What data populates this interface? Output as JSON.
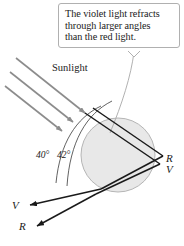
{
  "figure": {
    "background_color": "#ffffff",
    "width": 184,
    "height": 246
  },
  "callout": {
    "line1": "The violet light refracts",
    "line2": "through larger angles",
    "line3": "than the red light.",
    "border_color": "#b0b0b0",
    "background_color": "#ffffff"
  },
  "labels": {
    "sunlight": "Sunlight",
    "angle_inner": "40°",
    "angle_outer": "42°",
    "ray_r_right": "R",
    "ray_v_right": "V",
    "ray_v_left": "V",
    "ray_r_left": "R"
  },
  "colors": {
    "sunlight_ray": "#8c8c8c",
    "refracted_ray": "#1a1a1a",
    "raindrop_fill": "#e8e8e8",
    "raindrop_stroke": "#b5b5b5",
    "arc_stroke": "#3a3a3a",
    "leader_line": "#a8a8a8"
  }
}
